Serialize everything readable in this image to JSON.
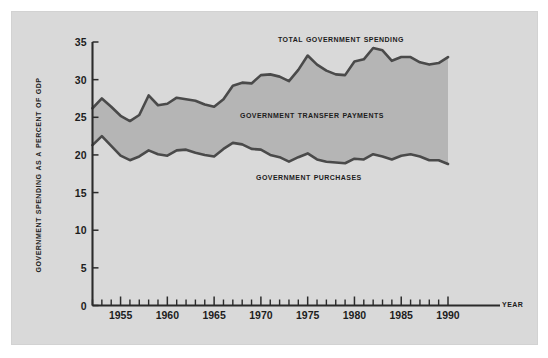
{
  "figure": {
    "background_color": "#ffffff",
    "panel_color": "#d9d9d9",
    "band_color": "#b5b5b5",
    "curve_color": "#4a4a4a"
  },
  "labels": {
    "total": "Total Government Spending",
    "transfer": "Government Transfer Payments",
    "purchases": "Government Purchases",
    "year_axis": "Year",
    "yaxis": "Government Spending as a Percent of GDP"
  },
  "chart_data": {
    "type": "area",
    "title": "",
    "subtitle": "",
    "xlabel": "Year",
    "ylabel": "Government Spending as a Percent of GDP",
    "xlim": [
      1952,
      1990
    ],
    "ylim": [
      0,
      35
    ],
    "yticks": [
      0,
      5,
      10,
      15,
      20,
      25,
      30,
      35
    ],
    "ytick_labels": [
      "0",
      "5",
      "10",
      "15",
      "20",
      "25",
      "30",
      "35"
    ],
    "xticks_labeled": [
      1955,
      1960,
      1965,
      1970,
      1975,
      1980,
      1985,
      1990
    ],
    "xtick_labels": [
      "1955",
      "1960",
      "1965",
      "1970",
      "1975",
      "1980",
      "1985",
      "1990"
    ],
    "xtick_minor_interval": 1,
    "grid": false,
    "legend_position": "inline-annotations",
    "annotations": [
      {
        "text": "Total Government Spending",
        "x": 1972,
        "y": 34.3
      },
      {
        "text": "Government Transfer Payments",
        "x": 1970,
        "y": 24.2
      },
      {
        "text": "Government Purchases",
        "x": 1971,
        "y": 16.1
      }
    ],
    "x": [
      1952,
      1953,
      1954,
      1955,
      1956,
      1957,
      1958,
      1959,
      1960,
      1961,
      1962,
      1963,
      1964,
      1965,
      1966,
      1967,
      1968,
      1969,
      1970,
      1971,
      1972,
      1973,
      1974,
      1975,
      1976,
      1977,
      1978,
      1979,
      1980,
      1981,
      1982,
      1983,
      1984,
      1985,
      1986,
      1987,
      1988,
      1989,
      1990
    ],
    "series": [
      {
        "name": "Total Government Spending",
        "values": [
          26.2,
          27.5,
          26.4,
          25.2,
          24.5,
          25.3,
          27.9,
          26.6,
          26.8,
          27.6,
          27.4,
          27.2,
          26.7,
          26.4,
          27.4,
          29.2,
          29.6,
          29.5,
          30.6,
          30.7,
          30.4,
          29.8,
          31.3,
          33.2,
          32.0,
          31.2,
          30.7,
          30.6,
          32.4,
          32.7,
          34.2,
          33.9,
          32.5,
          33.0,
          33.0,
          32.3,
          32.0,
          32.2,
          33.0
        ]
      },
      {
        "name": "Government Purchases",
        "values": [
          21.3,
          22.5,
          21.2,
          19.9,
          19.3,
          19.8,
          20.6,
          20.1,
          19.9,
          20.6,
          20.7,
          20.3,
          20.0,
          19.8,
          20.8,
          21.6,
          21.4,
          20.8,
          20.7,
          20.0,
          19.7,
          19.1,
          19.7,
          20.2,
          19.4,
          19.1,
          19.0,
          18.9,
          19.5,
          19.4,
          20.1,
          19.8,
          19.4,
          19.9,
          20.1,
          19.8,
          19.3,
          19.3,
          18.8
        ]
      }
    ],
    "derived_series": [
      {
        "name": "Government Transfer Payments (band between curves)",
        "values": [
          4.9,
          5.0,
          5.2,
          5.3,
          5.2,
          5.5,
          7.3,
          6.5,
          6.9,
          7.0,
          6.7,
          6.9,
          6.7,
          6.6,
          6.6,
          7.6,
          8.2,
          8.7,
          9.9,
          10.7,
          10.7,
          10.7,
          11.6,
          13.0,
          12.6,
          12.1,
          11.7,
          11.7,
          12.9,
          13.3,
          14.1,
          14.1,
          13.1,
          13.1,
          12.9,
          12.5,
          12.7,
          12.9,
          14.2
        ]
      }
    ]
  }
}
